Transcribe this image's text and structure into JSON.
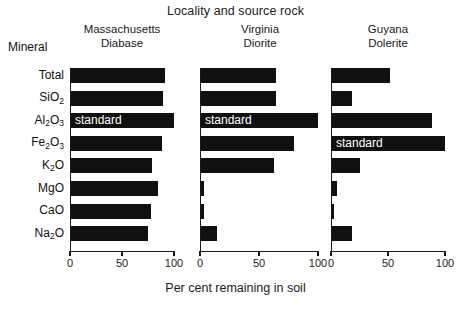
{
  "chart_data": {
    "type": "bar",
    "title": "Locality and source rock",
    "xlabel": "Per cent remaining in soil",
    "ylabel": "Mineral",
    "orientation": "horizontal",
    "grid": false,
    "legend": null,
    "xlim": [
      0,
      100
    ],
    "xticks": [
      0,
      50,
      100
    ],
    "xtick_labels": [
      "0",
      "50",
      "100"
    ],
    "categories": [
      "Total",
      "SiO2",
      "Al2O3",
      "Fe2O3",
      "K2O",
      "MgO",
      "CaO",
      "Na2O"
    ],
    "category_labels_html": [
      "Total",
      "SiO<sub>2</sub>",
      "Al<sub>2</sub>O<sub>3</sub>",
      "Fe<sub>2</sub>O<sub>3</sub>",
      "K<sub>2</sub>O",
      "MgO",
      "CaO",
      "Na<sub>2</sub>O"
    ],
    "annotation_text": "standard",
    "series": [
      {
        "name": "Massachusetts Diabase",
        "locality": "Massachusetts",
        "rock": "Diabase",
        "values": [
          91,
          89,
          100,
          88,
          79,
          85,
          78,
          75
        ],
        "standard_index": 2
      },
      {
        "name": "Virginia Diorite",
        "locality": "Virginia",
        "rock": "Diorite",
        "values": [
          64,
          64,
          100,
          80,
          63,
          3,
          3,
          14
        ],
        "standard_index": 2
      },
      {
        "name": "Guyana Dolerite",
        "locality": "Guyana",
        "rock": "Dolerite",
        "values": [
          52,
          18,
          89,
          100,
          25,
          5,
          3,
          18
        ],
        "standard_index": 3
      }
    ],
    "bar_color": "#101010",
    "background_color": "#ffffff",
    "text_color": "#1a1a1a"
  },
  "header": {
    "title": "Locality and source rock",
    "mineral_column_header": "Mineral"
  },
  "panels": [
    {
      "locality": "Massachusetts",
      "rock": "Diabase"
    },
    {
      "locality": "Virginia",
      "rock": "Diorite"
    },
    {
      "locality": "Guyana",
      "rock": "Dolerite"
    }
  ],
  "axis": {
    "x_title": "Per cent remaining in soil",
    "tick_labels": [
      "0",
      "50",
      "100"
    ]
  }
}
